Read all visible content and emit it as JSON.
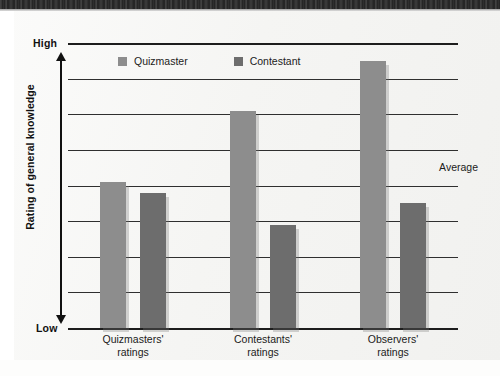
{
  "figure": {
    "axis": {
      "y_top_label": "High",
      "y_bottom_label": "Low",
      "y_title": "Rating of general knowledge"
    },
    "annotation": {
      "average_label": "Average"
    },
    "legend": {
      "items": [
        {
          "label": "Quizmaster",
          "color": "#8d8d8d"
        },
        {
          "label": "Contestant",
          "color": "#6d6d6d"
        }
      ]
    },
    "categories": [
      {
        "line1": "Quizmasters'",
        "line2": "ratings"
      },
      {
        "line1": "Contestants'",
        "line2": "ratings"
      },
      {
        "line1": "Observers'",
        "line2": "ratings"
      }
    ]
  },
  "chart_data": {
    "type": "bar",
    "title": "",
    "xlabel": "",
    "ylabel": "Rating of general knowledge",
    "categories": [
      "Quizmasters' ratings",
      "Contestants' ratings",
      "Observers' ratings"
    ],
    "series": [
      {
        "name": "Quizmaster",
        "color": "#8d8d8d",
        "values": [
          4.1,
          6.1,
          7.5
        ]
      },
      {
        "name": "Contestant",
        "color": "#6d6d6d",
        "values": [
          3.8,
          2.9,
          3.5
        ]
      }
    ],
    "ylim": [
      0,
      8
    ],
    "ytick_labels": [
      "Low",
      "High"
    ],
    "gridlines": 9,
    "grid": true,
    "legend_position": "top-left-inside",
    "annotations": [
      {
        "text": "Average",
        "x": "right",
        "y": 4.0
      }
    ]
  }
}
